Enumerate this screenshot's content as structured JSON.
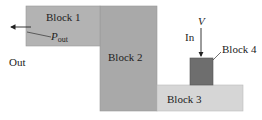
{
  "diagram": {
    "blocks": [
      {
        "id": "block1",
        "label": "Block 1",
        "color": "#b3b3b3"
      },
      {
        "id": "block2",
        "label": "Block 2",
        "color": "#a9a9a9"
      },
      {
        "id": "block3",
        "label": "Block 3",
        "color": "#d6d6d6"
      },
      {
        "id": "block4",
        "label": "Block 4",
        "color": "#6e6e6e"
      }
    ],
    "labels": {
      "out": "Out",
      "in": "In",
      "v": "V",
      "p": "P",
      "p_sub": "out"
    }
  }
}
